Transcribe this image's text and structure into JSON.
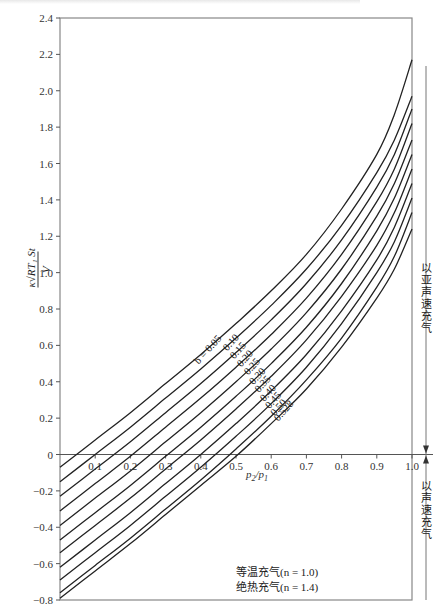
{
  "chart_data": {
    "type": "line",
    "title": "",
    "xlabel": "p2/p1",
    "ylabel": "κ√(RT1) S t / V",
    "xlim": [
      0,
      1.0
    ],
    "ylim": [
      -0.8,
      2.4
    ],
    "xticks": [
      0.1,
      0.2,
      0.3,
      0.4,
      0.5,
      0.6,
      0.7,
      0.8,
      0.9,
      1.0
    ],
    "yticks": [
      2.4,
      2.2,
      2.0,
      1.8,
      1.6,
      1.4,
      1.2,
      1.0,
      0.8,
      0.6,
      0.4,
      0.2,
      0,
      -0.2,
      -0.4,
      -0.6,
      -0.8
    ],
    "grid": false,
    "legend_position": "curve labels inline (b = ...)",
    "x": [
      0,
      0.1,
      0.2,
      0.3,
      0.4,
      0.5,
      0.6,
      0.7,
      0.8,
      0.9,
      0.95,
      1.0
    ],
    "series": [
      {
        "name": "b = 0.05",
        "values": [
          -0.07,
          0.08,
          0.23,
          0.39,
          0.55,
          0.72,
          0.9,
          1.1,
          1.35,
          1.65,
          1.87,
          2.17
        ]
      },
      {
        "name": "0.10",
        "values": [
          -0.15,
          0.0,
          0.15,
          0.31,
          0.47,
          0.64,
          0.82,
          1.02,
          1.26,
          1.55,
          1.73,
          1.97
        ]
      },
      {
        "name": "0.15",
        "values": [
          -0.23,
          -0.08,
          0.07,
          0.23,
          0.39,
          0.56,
          0.74,
          0.94,
          1.18,
          1.47,
          1.65,
          1.9
        ]
      },
      {
        "name": "0.20",
        "values": [
          -0.31,
          -0.16,
          -0.01,
          0.15,
          0.31,
          0.48,
          0.66,
          0.86,
          1.1,
          1.39,
          1.57,
          1.82
        ]
      },
      {
        "name": "0.25",
        "values": [
          -0.39,
          -0.24,
          -0.09,
          0.07,
          0.23,
          0.4,
          0.58,
          0.78,
          1.02,
          1.31,
          1.49,
          1.73
        ]
      },
      {
        "name": "0.30",
        "values": [
          -0.47,
          -0.32,
          -0.17,
          -0.01,
          0.15,
          0.32,
          0.5,
          0.7,
          0.94,
          1.23,
          1.41,
          1.65
        ]
      },
      {
        "name": "0.35",
        "values": [
          -0.54,
          -0.39,
          -0.24,
          -0.08,
          0.08,
          0.25,
          0.43,
          0.63,
          0.87,
          1.15,
          1.33,
          1.57
        ]
      },
      {
        "name": "0.40",
        "values": [
          -0.62,
          -0.47,
          -0.32,
          -0.16,
          0.0,
          0.17,
          0.35,
          0.55,
          0.79,
          1.07,
          1.25,
          1.49
        ]
      },
      {
        "name": "0.45",
        "values": [
          -0.69,
          -0.54,
          -0.39,
          -0.23,
          -0.07,
          0.1,
          0.28,
          0.48,
          0.72,
          1.0,
          1.17,
          1.41
        ]
      },
      {
        "name": "0.50",
        "values": [
          -0.76,
          -0.61,
          -0.46,
          -0.3,
          -0.14,
          0.03,
          0.21,
          0.41,
          0.64,
          0.92,
          1.09,
          1.33
        ]
      },
      {
        "name": "0.528",
        "values": [
          -0.79,
          -0.64,
          -0.49,
          -0.33,
          -0.17,
          -0.01,
          0.17,
          0.36,
          0.59,
          0.86,
          1.02,
          1.24
        ]
      }
    ],
    "annotations": [
      "以亚声速充气",
      "以声速充气",
      "等温充气(n = 1.0)",
      "绝热充气(n = 1.4)"
    ]
  },
  "axis": {
    "x_label_main": "p",
    "x_label_sub1": "2",
    "x_label_slash": "/p",
    "x_label_sub2": "1",
    "y_label_num": "κ√RT₁ St",
    "y_label_den": "V"
  },
  "annotations": {
    "subsonic": "以亚声速充气",
    "sonic": "以声速充气",
    "isothermal": "等温充气(n = 1.0)",
    "adiabatic": "绝热充气(n = 1.4)"
  },
  "curve_labels": [
    "b = 0.05",
    "0.10",
    "0.15",
    "0.20",
    "0.25",
    "0.30",
    "0.35",
    "0.40",
    "0.45",
    "0.50",
    "0.528"
  ]
}
